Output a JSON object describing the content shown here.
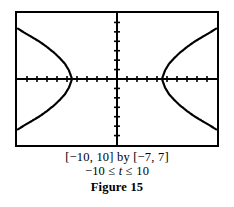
{
  "figure": {
    "caption_window": "[−10, 10] by [−7, 7]",
    "caption_param_prefix": "−10 ≤ ",
    "caption_param_var": "t",
    "caption_param_suffix": " ≤ 10",
    "caption_label": "Figure 15",
    "ink_color": "#000000",
    "background_color": "#ffffff"
  },
  "chart_data": {
    "type": "line",
    "title": "",
    "subtitle": "",
    "xlabel": "",
    "ylabel": "",
    "xlim": [
      -10,
      10
    ],
    "ylim": [
      -7,
      7
    ],
    "grid": false,
    "legend": "none",
    "axes": {
      "x_axis_y": 0,
      "y_axis_x": 0,
      "tick_spacing_x": 1,
      "tick_spacing_y": 1,
      "x_ticks": [
        -9,
        -8,
        -7,
        -6,
        -5,
        -4,
        -3,
        -2,
        -1,
        1,
        2,
        3,
        4,
        5,
        6,
        7,
        8,
        9
      ],
      "y_ticks": [
        -6,
        -5,
        -4,
        -3,
        -2,
        -1,
        1,
        2,
        3,
        4,
        5,
        6
      ],
      "tick_length_px": 3,
      "tick_style": "dotted-marks",
      "axis_line_width_px": 2,
      "frame_line_width_px": 2
    },
    "parameter": {
      "name": "t",
      "min": -10,
      "max": 10
    },
    "curve": {
      "shape": "hyperbola",
      "orientation": "horizontal",
      "center": [
        0,
        0
      ],
      "vertex_left": [
        -4.5,
        0
      ],
      "vertex_right": [
        4.5,
        0
      ],
      "a": 4.5,
      "b": 3.1,
      "plot_style": "dotted-trace",
      "branches": [
        {
          "name": "left-branch-upper",
          "points": [
            [
              -4.5,
              0
            ],
            [
              -4.8,
              0.9
            ],
            [
              -5.2,
              1.6
            ],
            [
              -5.7,
              2.2
            ],
            [
              -6.3,
              2.8
            ],
            [
              -7.0,
              3.4
            ],
            [
              -7.8,
              4.0
            ],
            [
              -8.6,
              4.5
            ],
            [
              -9.4,
              5.0
            ],
            [
              -10,
              5.4
            ]
          ]
        },
        {
          "name": "left-branch-lower",
          "points": [
            [
              -4.5,
              0
            ],
            [
              -4.8,
              -0.9
            ],
            [
              -5.2,
              -1.6
            ],
            [
              -5.7,
              -2.2
            ],
            [
              -6.3,
              -2.8
            ],
            [
              -7.0,
              -3.4
            ],
            [
              -7.8,
              -4.0
            ],
            [
              -8.6,
              -4.5
            ],
            [
              -9.4,
              -5.0
            ],
            [
              -10,
              -5.4
            ]
          ]
        },
        {
          "name": "right-branch-upper",
          "points": [
            [
              4.5,
              0
            ],
            [
              4.8,
              0.9
            ],
            [
              5.2,
              1.6
            ],
            [
              5.7,
              2.2
            ],
            [
              6.3,
              2.8
            ],
            [
              7.0,
              3.4
            ],
            [
              7.8,
              4.0
            ],
            [
              8.6,
              4.5
            ],
            [
              9.4,
              5.0
            ],
            [
              10,
              5.4
            ]
          ]
        },
        {
          "name": "right-branch-lower",
          "points": [
            [
              4.5,
              0
            ],
            [
              4.8,
              -0.9
            ],
            [
              5.2,
              -1.6
            ],
            [
              5.7,
              -2.2
            ],
            [
              6.3,
              -2.8
            ],
            [
              7.0,
              -3.4
            ],
            [
              7.8,
              -4.0
            ],
            [
              8.6,
              -4.5
            ],
            [
              9.4,
              -5.0
            ],
            [
              10,
              -5.4
            ]
          ]
        }
      ]
    }
  }
}
